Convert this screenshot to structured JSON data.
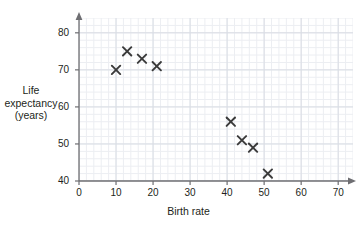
{
  "chart_data": {
    "type": "scatter",
    "title": "",
    "xlabel": "Birth rate",
    "ylabel": "Life expectancy (years)",
    "ylabel_lines": [
      "Life",
      "expectancy",
      "(years)"
    ],
    "xlim": [
      0,
      74
    ],
    "ylim": [
      40,
      84
    ],
    "xticks": [
      0,
      10,
      20,
      30,
      40,
      50,
      60,
      70
    ],
    "yticks": [
      40,
      50,
      60,
      70,
      80
    ],
    "xtick_labels": [
      "0",
      "10",
      "20",
      "30",
      "40",
      "50",
      "60",
      "70"
    ],
    "ytick_labels": [
      "40",
      "50",
      "60",
      "70",
      "80"
    ],
    "grid": true,
    "grid_major_step_x": 10,
    "grid_major_step_y": 10,
    "grid_minor_step_x": 2,
    "grid_minor_step_y": 2,
    "legend": null,
    "marker": "x",
    "marker_color": "#3a3a3a",
    "grid_color": "#d9dde4",
    "grid_minor_color": "#eceef2",
    "axis_color": "#6e6e72",
    "points": [
      {
        "x": 10,
        "y": 70
      },
      {
        "x": 13,
        "y": 75
      },
      {
        "x": 17,
        "y": 73
      },
      {
        "x": 21,
        "y": 71
      },
      {
        "x": 41,
        "y": 56
      },
      {
        "x": 44,
        "y": 51
      },
      {
        "x": 47,
        "y": 49
      },
      {
        "x": 51,
        "y": 42
      }
    ]
  }
}
